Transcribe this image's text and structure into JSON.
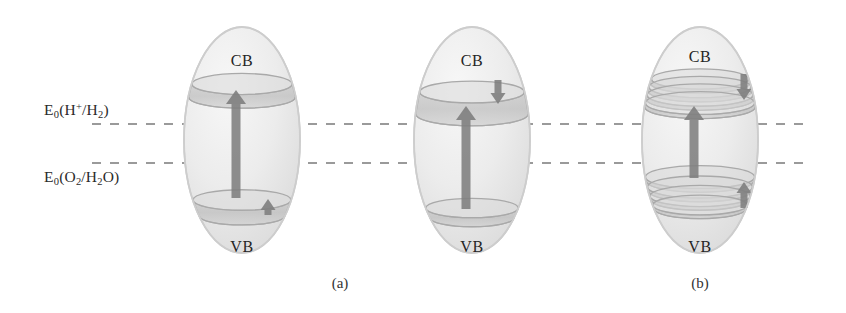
{
  "figure": {
    "type": "semiconductor-band-diagram",
    "background": "#ffffff",
    "ink_color": "#2a2a2a",
    "arrow_color": "#7e7e7e",
    "band_color": "#b9b9b9",
    "sphere_fill": "#ededed",
    "sphere_edge": "#cdcdcd",
    "dash_color": "#9a9a9a"
  },
  "potential_axis": {
    "lines": [
      {
        "id": "h-redox",
        "label_html": "E<sub>0</sub>(H<sup>+</sup>/H<sub>2</sub>)",
        "label_text": "E0(H+/H2)",
        "y": 124,
        "x_start": 92,
        "x_end": 806
      },
      {
        "id": "o-redox",
        "label_html": "E<sub>0</sub>(O<sub>2</sub>/H<sub>2</sub>O)",
        "label_text": "E0(O2/H2O)",
        "y": 163,
        "x_start": 92,
        "x_end": 806
      }
    ]
  },
  "labels": {
    "h_redox_prefix": "E",
    "h_redox_sub": "0",
    "h_redox_open": "(H",
    "h_redox_sup": "+",
    "h_redox_mid": "/H",
    "h_redox_sub2": "2",
    "h_redox_close": ")",
    "o_redox_prefix": "E",
    "o_redox_sub": "0",
    "o_redox_open": "(O",
    "o_redox_sub2": "2",
    "o_redox_mid": "/H",
    "o_redox_sub3": "2",
    "o_redox_tail": "O",
    "o_redox_close": ")",
    "conduction_band": "CB",
    "valence_band": "VB"
  },
  "particles": [
    {
      "id": "bulk-particle",
      "center_x": 242,
      "center_y": 140,
      "rx": 58,
      "ry": 113,
      "cb_label": "CB",
      "cb_label_y": 52,
      "vb_label": "VB",
      "vb_label_y": 238,
      "cb_levels": [
        {
          "y": 84,
          "thickness": 13
        }
      ],
      "vb_levels": [
        {
          "y": 200,
          "thickness": 16
        }
      ],
      "main_arrow": {
        "direction": "up",
        "x": 236,
        "y_top": 90,
        "y_bottom": 198
      },
      "aux_arrows": [
        {
          "direction": "up",
          "x": 268,
          "y_top": 199,
          "y_bottom": 215,
          "size": "small"
        }
      ]
    },
    {
      "id": "intermediate-particle",
      "center_x": 472,
      "center_y": 140,
      "rx": 58,
      "ry": 113,
      "cb_label": "CB",
      "cb_label_y": 52,
      "vb_label": "VB",
      "vb_label_y": 238,
      "cb_levels": [
        {
          "y": 92,
          "thickness": 22
        }
      ],
      "vb_levels": [
        {
          "y": 208,
          "thickness": 10
        }
      ],
      "main_arrow": {
        "direction": "up",
        "x": 466,
        "y_top": 106,
        "y_bottom": 209
      },
      "aux_arrows": [
        {
          "direction": "down",
          "x": 498,
          "y_top": 80,
          "y_bottom": 104,
          "size": "small"
        }
      ]
    },
    {
      "id": "quantum-particle",
      "center_x": 700,
      "center_y": 140,
      "rx": 58,
      "ry": 113,
      "cb_label": "CB",
      "cb_label_y": 48,
      "vb_label": "VB",
      "vb_label_y": 238,
      "cb_levels": [
        {
          "y": 79,
          "thickness": 4
        },
        {
          "y": 87,
          "thickness": 4
        },
        {
          "y": 95,
          "thickness": 4
        },
        {
          "y": 103,
          "thickness": 4
        }
      ],
      "vb_levels": [
        {
          "y": 177,
          "thickness": 4
        },
        {
          "y": 187,
          "thickness": 4
        },
        {
          "y": 196,
          "thickness": 4
        },
        {
          "y": 205,
          "thickness": 4
        }
      ],
      "main_arrow": {
        "direction": "up",
        "x": 694,
        "y_top": 106,
        "y_bottom": 178
      },
      "aux_arrows": [
        {
          "direction": "down",
          "x": 744,
          "y_top": 74,
          "y_bottom": 100,
          "size": "small"
        },
        {
          "direction": "up",
          "x": 744,
          "y_top": 182,
          "y_bottom": 208,
          "size": "small"
        }
      ]
    }
  ],
  "captions": [
    {
      "id": "caption-a",
      "text": "(a)",
      "x": 340,
      "y": 275
    },
    {
      "id": "caption-b",
      "text": "(b)",
      "x": 700,
      "y": 275
    }
  ]
}
